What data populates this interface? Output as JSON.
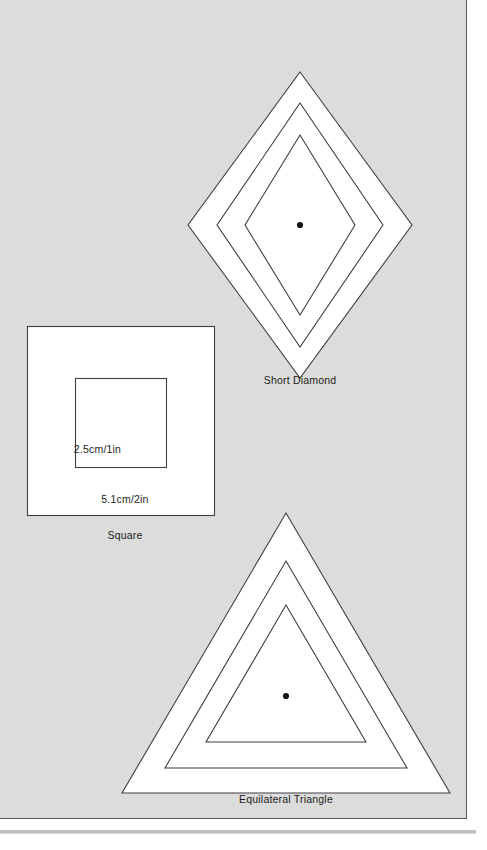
{
  "page": {
    "background_color": "#dcdcdc",
    "border_color": "#5a5a5a",
    "stroke_color": "#3f3f42",
    "shape_fill": "#ffffff"
  },
  "figures": [
    {
      "id": "short-diamond",
      "caption": "Short Diamond",
      "shape": "diamond",
      "rings": 3,
      "has_center_dot": true,
      "dimension_labels": []
    },
    {
      "id": "square",
      "caption": "Square",
      "shape": "square",
      "rings": 2,
      "has_center_dot": false,
      "dimension_labels": [
        {
          "name": "inner-size",
          "text": "2.5cm/1in"
        },
        {
          "name": "outer-size",
          "text": "5.1cm/2in"
        }
      ]
    },
    {
      "id": "equilateral-triangle",
      "caption": "Equilateral Triangle",
      "shape": "triangle",
      "rings": 3,
      "has_center_dot": true,
      "dimension_labels": []
    }
  ],
  "captions": {
    "diamond": "Short Diamond",
    "square": "Square",
    "triangle": "Equilateral Triangle"
  },
  "dimensions": {
    "square_inner": "2.5cm/1in",
    "square_outer": "5.1cm/2in"
  }
}
